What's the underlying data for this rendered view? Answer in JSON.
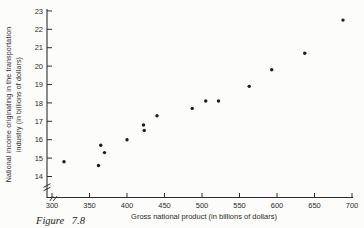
{
  "figure": {
    "caption": "Figure 7.8"
  },
  "chart_data": {
    "type": "scatter",
    "title": "",
    "xlabel": "Gross national product (in billions of dollars)",
    "ylabel": "National income originating in the transportation industry (in billions of dollars)",
    "ylabel_lines": [
      "National income originating in the transportation",
      "industry (in billions of dollars)"
    ],
    "xlim": [
      300,
      700
    ],
    "ylim": [
      14,
      23
    ],
    "x_ticks": [
      300,
      350,
      400,
      450,
      500,
      550,
      600,
      650,
      700
    ],
    "y_ticks": [
      14,
      15,
      16,
      17,
      18,
      19,
      20,
      21,
      22,
      23
    ],
    "grid": false,
    "legend": false,
    "axis_break_x": true,
    "axis_break_y": true,
    "axis_color": "#2e2e2e",
    "point_color": "#1c1c1c",
    "points": [
      [
        316,
        14.8
      ],
      [
        362,
        14.6
      ],
      [
        365,
        15.7
      ],
      [
        370,
        15.3
      ],
      [
        400,
        16.0
      ],
      [
        422,
        16.8
      ],
      [
        423,
        16.5
      ],
      [
        440,
        17.3
      ],
      [
        487,
        17.7
      ],
      [
        505,
        18.1
      ],
      [
        522,
        18.1
      ],
      [
        563,
        18.9
      ],
      [
        593,
        19.8
      ],
      [
        637,
        20.7
      ],
      [
        688,
        22.5
      ]
    ]
  }
}
